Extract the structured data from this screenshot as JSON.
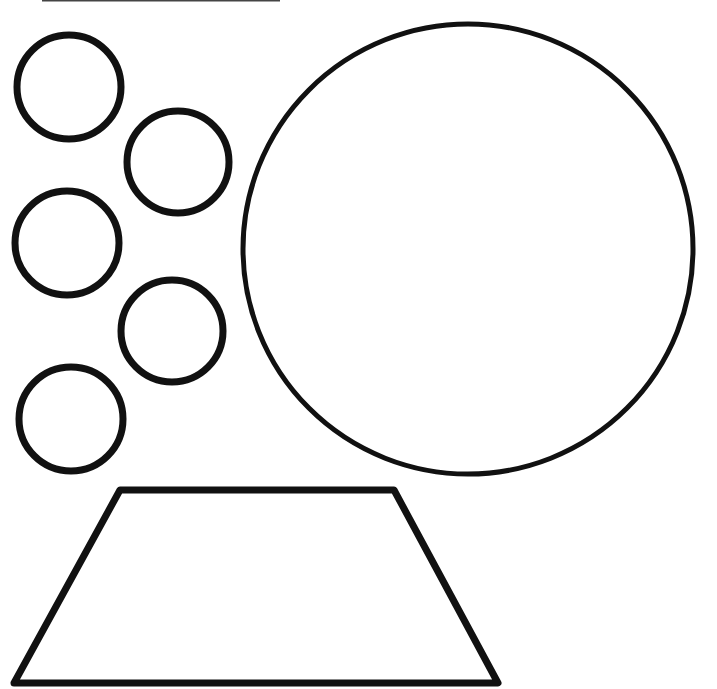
{
  "canvas": {
    "width": 717,
    "height": 689,
    "background": "#ffffff",
    "stroke_color": "#111111"
  },
  "top_rule": {
    "x1": 42,
    "y1": 0.5,
    "x2": 280,
    "y2": 0.5,
    "width": 2,
    "color": "#444444"
  },
  "small_circles": [
    {
      "cx": 69,
      "cy": 87,
      "r": 52,
      "stroke_width": 7
    },
    {
      "cx": 178,
      "cy": 162,
      "r": 51,
      "stroke_width": 7
    },
    {
      "cx": 67,
      "cy": 243,
      "r": 52,
      "stroke_width": 7
    },
    {
      "cx": 172,
      "cy": 331,
      "r": 51,
      "stroke_width": 7
    },
    {
      "cx": 71,
      "cy": 419,
      "r": 52,
      "stroke_width": 7
    }
  ],
  "large_circle": {
    "cx": 468,
    "cy": 249,
    "r": 225,
    "stroke_width": 5
  },
  "trapezoid": {
    "points": [
      [
        120,
        490
      ],
      [
        394,
        490
      ],
      [
        498,
        683
      ],
      [
        14,
        683
      ]
    ],
    "stroke_width": 7
  }
}
